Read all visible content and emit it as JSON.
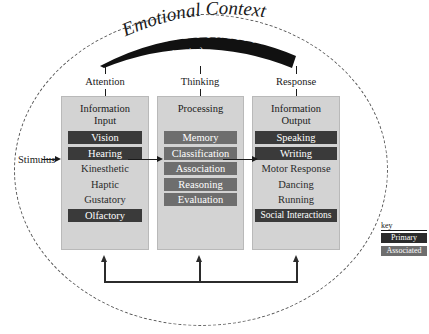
{
  "diagram": {
    "title": "Emotional Context",
    "banner": {
      "title": "EXECUTIVE FUNCTION",
      "subtitle": "(choosing)"
    },
    "stimulus_label": "Stimulus",
    "channels": [
      {
        "label": "Attention"
      },
      {
        "label": "Thinking"
      },
      {
        "label": "Response"
      }
    ],
    "panels": [
      {
        "name": "information-input",
        "title": "Information\nInput",
        "items": [
          {
            "label": "Vision",
            "style": "primary"
          },
          {
            "label": "Hearing",
            "style": "primary"
          },
          {
            "label": "Kinesthetic",
            "style": "plain"
          },
          {
            "label": "Haptic",
            "style": "plain"
          },
          {
            "label": "Gustatory",
            "style": "plain"
          },
          {
            "label": "Olfactory",
            "style": "primary"
          }
        ]
      },
      {
        "name": "processing",
        "title": "Processing",
        "items": [
          {
            "label": "Memory",
            "style": "associated"
          },
          {
            "label": "Classification",
            "style": "associated"
          },
          {
            "label": "Association",
            "style": "associated"
          },
          {
            "label": "Reasoning",
            "style": "associated"
          },
          {
            "label": "Evaluation",
            "style": "associated"
          }
        ]
      },
      {
        "name": "information-output",
        "title": "Information\nOutput",
        "items": [
          {
            "label": "Speaking",
            "style": "primary"
          },
          {
            "label": "Writing",
            "style": "primary"
          },
          {
            "label": "Motor Response",
            "style": "plain"
          },
          {
            "label": "Dancing",
            "style": "plain"
          },
          {
            "label": "Running",
            "style": "plain"
          },
          {
            "label": "Social Interactions",
            "style": "primary"
          }
        ]
      }
    ],
    "key": {
      "label": "key",
      "entries": [
        {
          "label": "Primary",
          "style": "primary",
          "color": "#2b2b2b"
        },
        {
          "label": "Associated",
          "style": "associated",
          "color": "#6e6e6e"
        }
      ]
    },
    "colors": {
      "panel_fill": "#d3d3d3",
      "primary": "#2b2b2b",
      "associated": "#6e6e6e",
      "banner": "#111111",
      "outline": "#5a5a5a"
    }
  }
}
